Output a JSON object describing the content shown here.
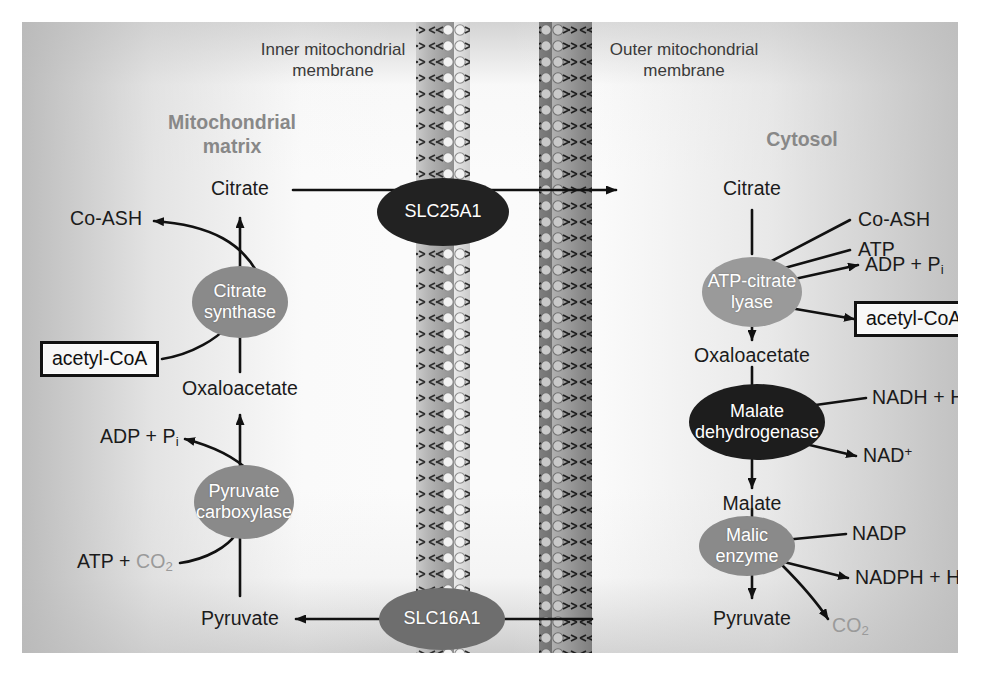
{
  "figure": {
    "regions": [
      {
        "id": "matrix",
        "label": "Mitochondrial\nmatrix",
        "x": 210,
        "y": 100,
        "color": "#888888"
      },
      {
        "id": "cytosol",
        "label": "Cytosol",
        "x": 780,
        "y": 117,
        "color": "#888888"
      }
    ],
    "membranes": [
      {
        "id": "inner",
        "label": "Inner mitochondrial\nmembrane",
        "label_x": 311,
        "label_y": 35,
        "x": 394,
        "width": 54
      },
      {
        "id": "outer",
        "label": "Outer mitochondrial\nmembrane",
        "label_x": 662,
        "label_y": 35,
        "x": 517,
        "width": 53
      }
    ],
    "metabolites": {
      "matrix_citrate": "Citrate",
      "matrix_coash": "Co-ASH",
      "matrix_oxaloacetate": "Oxaloacetate",
      "matrix_adp_pi": "ADP + P",
      "matrix_adp_pi_sub": "i",
      "matrix_atp_co2_prefix": "ATP + ",
      "matrix_co2": "CO",
      "matrix_co2_sub": "2",
      "matrix_pyruvate": "Pyruvate",
      "matrix_acetyl_coa": "acetyl-CoA",
      "cyt_citrate": "Citrate",
      "cyt_coash": "Co-ASH",
      "cyt_atp": "ATP",
      "cyt_adp_pi": "ADP + P",
      "cyt_adp_pi_sub": "i",
      "cyt_acetyl_coa": "acetyl-CoA",
      "cyt_oxaloacetate": "Oxaloacetate",
      "cyt_nadh_h": "NADH + H",
      "cyt_nadh_h_sup": "+",
      "cyt_nad": "NAD",
      "cyt_nad_sup": "+",
      "cyt_malate": "Malate",
      "cyt_nadp": "NADP",
      "cyt_nadph_h": "NADPH + H",
      "cyt_nadph_h_sup": "+",
      "cyt_co2": "CO",
      "cyt_co2_sub": "2",
      "cyt_pyruvate": "Pyruvate"
    },
    "enzymes": [
      {
        "id": "citrate-synthase",
        "label": "Citrate\nsynthase",
        "cx": 218,
        "cy": 280,
        "rx": 48,
        "ry": 36,
        "fill": "#8a8a8a"
      },
      {
        "id": "pyruvate-carboxylase",
        "label": "Pyruvate\ncarboxylase",
        "cx": 222,
        "cy": 480,
        "rx": 50,
        "ry": 37,
        "fill": "#8a8a8a"
      },
      {
        "id": "atp-citrate-lyase",
        "label": "ATP-citrate\nlyase",
        "cx": 730,
        "cy": 270,
        "rx": 50,
        "ry": 35,
        "fill": "#9a9a9a"
      },
      {
        "id": "malate-dehydrogenase",
        "label": "Malate\ndehydrogenase",
        "cx": 735,
        "cy": 400,
        "rx": 68,
        "ry": 38,
        "fill": "#1d1d1d"
      },
      {
        "id": "malic-enzyme",
        "label": "Malic\nenzyme",
        "cx": 725,
        "cy": 524,
        "rx": 48,
        "ry": 30,
        "fill": "#8a8a8a"
      }
    ],
    "transporters": [
      {
        "id": "slc25a1",
        "label": "SLC25A1",
        "cx": 421,
        "cy": 190,
        "rx": 66,
        "ry": 34,
        "fill": "#222222"
      },
      {
        "id": "slc16a1",
        "label": "SLC16A1",
        "cx": 420,
        "cy": 597,
        "rx": 63,
        "ry": 31,
        "fill": "#6e6e6e"
      }
    ],
    "colors": {
      "co2": "#9a9a9a",
      "region_label": "#888888",
      "stroke": "#111111"
    }
  }
}
